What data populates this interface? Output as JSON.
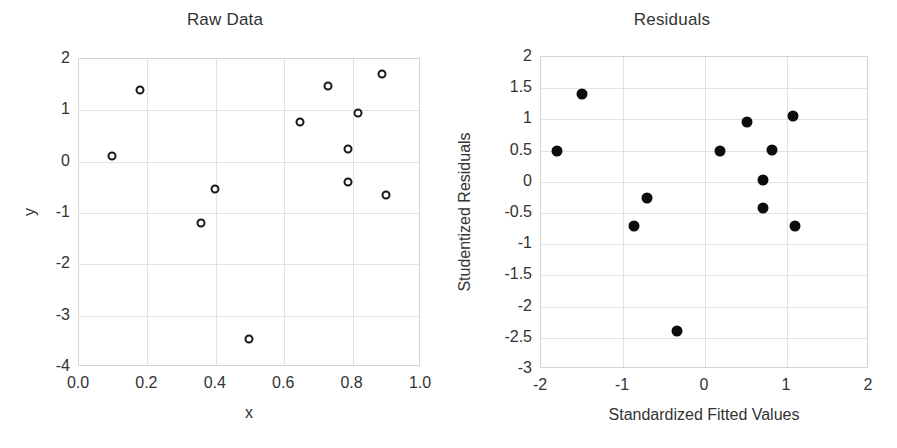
{
  "figure": {
    "background": "#ffffff",
    "panel_count": 2
  },
  "chart_data": [
    {
      "id": "raw-data",
      "type": "scatter",
      "title": "Raw Data",
      "xlabel": "x",
      "ylabel": "y",
      "xlim": [
        0.0,
        1.0
      ],
      "ylim": [
        -4,
        2
      ],
      "xticks": [
        "0.0",
        "0.2",
        "0.4",
        "0.6",
        "0.8",
        "1.0"
      ],
      "xtick_values": [
        0.0,
        0.2,
        0.4,
        0.6,
        0.8,
        1.0
      ],
      "yticks": [
        "2",
        "1",
        "0",
        "-1",
        "-2",
        "-3",
        "-4"
      ],
      "ytick_values": [
        2,
        1,
        0,
        -1,
        -2,
        -3,
        -4
      ],
      "grid": true,
      "legend": null,
      "marker_style": "open-circle",
      "marker_color": "#1a1a1a",
      "points": [
        {
          "x": 0.1,
          "y": 0.1
        },
        {
          "x": 0.18,
          "y": 1.38
        },
        {
          "x": 0.36,
          "y": -1.22
        },
        {
          "x": 0.4,
          "y": -0.55
        },
        {
          "x": 0.5,
          "y": -3.47
        },
        {
          "x": 0.65,
          "y": 0.76
        },
        {
          "x": 0.73,
          "y": 1.45
        },
        {
          "x": 0.79,
          "y": 0.22
        },
        {
          "x": 0.79,
          "y": -0.42
        },
        {
          "x": 0.82,
          "y": 0.92
        },
        {
          "x": 0.89,
          "y": 1.68
        },
        {
          "x": 0.9,
          "y": -0.66
        }
      ]
    },
    {
      "id": "residuals",
      "type": "scatter",
      "title": "Residuals",
      "xlabel": "Standardized Fitted Values",
      "ylabel": "Studentized Residuals",
      "xlim": [
        -2,
        2
      ],
      "ylim": [
        -3,
        2
      ],
      "xticks": [
        "-2",
        "-1",
        "0",
        "1",
        "2"
      ],
      "xtick_values": [
        -2,
        -1,
        0,
        1,
        2
      ],
      "yticks": [
        "2",
        "1.5",
        "1",
        "0.5",
        "0",
        "-0.5",
        "-1",
        "-1.5",
        "-2",
        "-2.5",
        "-3"
      ],
      "ytick_values": [
        2,
        1.5,
        1,
        0.5,
        0,
        -0.5,
        -1,
        -1.5,
        -2,
        -2.5,
        -3
      ],
      "grid": true,
      "legend": null,
      "marker_style": "filled-circle",
      "marker_color": "#0d0d0d",
      "points": [
        {
          "x": -1.79,
          "y": 0.48
        },
        {
          "x": -1.49,
          "y": 1.39
        },
        {
          "x": -0.85,
          "y": -0.73
        },
        {
          "x": -0.69,
          "y": -0.28
        },
        {
          "x": -0.33,
          "y": -2.4
        },
        {
          "x": 0.2,
          "y": 0.48
        },
        {
          "x": 0.53,
          "y": 0.94
        },
        {
          "x": 0.72,
          "y": 0.02
        },
        {
          "x": 0.72,
          "y": -0.44
        },
        {
          "x": 0.83,
          "y": 0.5
        },
        {
          "x": 1.08,
          "y": 1.04
        },
        {
          "x": 1.11,
          "y": -0.72
        }
      ]
    }
  ]
}
